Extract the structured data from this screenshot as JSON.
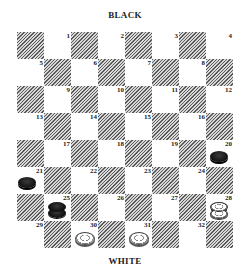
{
  "labels": {
    "top": "BLACK",
    "bottom": "WHITE"
  },
  "board": {
    "rows": 8,
    "cols": 8,
    "square_numbers": [
      "1",
      "2",
      "3",
      "4",
      "5",
      "6",
      "7",
      "8",
      "9",
      "10",
      "11",
      "12",
      "13",
      "14",
      "15",
      "16",
      "17",
      "18",
      "19",
      "20",
      "21",
      "22",
      "23",
      "24",
      "25",
      "26",
      "27",
      "28",
      "29",
      "30",
      "31",
      "32"
    ],
    "dark_square_style": "diagonal-hatch",
    "colors": {
      "hatch_line": "#5a5a5a",
      "light_square": "#ffffff",
      "black_piece": "#111111",
      "white_piece": "#f0f0f0"
    }
  },
  "pieces": [
    {
      "square": 20,
      "color": "black",
      "type": "man",
      "icon": "black-checker-icon"
    },
    {
      "square": 21,
      "color": "black",
      "type": "man",
      "icon": "black-checker-icon"
    },
    {
      "square": 25,
      "color": "black",
      "type": "king",
      "icon": "black-king-icon"
    },
    {
      "square": 28,
      "color": "white",
      "type": "king",
      "icon": "white-king-icon"
    },
    {
      "square": 30,
      "color": "white",
      "type": "man",
      "icon": "white-checker-icon"
    },
    {
      "square": 31,
      "color": "white",
      "type": "man",
      "icon": "white-checker-icon"
    }
  ]
}
